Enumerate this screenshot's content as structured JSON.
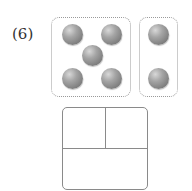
{
  "problem": {
    "number_label": "(6)",
    "groups": [
      {
        "name": "left-group",
        "ball_count": 5,
        "arrangement": "dice-five"
      },
      {
        "name": "right-group",
        "ball_count": 2,
        "arrangement": "vertical-pair"
      }
    ],
    "answer_box": {
      "cells": [
        "",
        "",
        ""
      ]
    },
    "colors": {
      "ball": "#8c8c8c",
      "group_border": "#9a9a9a",
      "box_border": "#8a8a8a"
    }
  }
}
